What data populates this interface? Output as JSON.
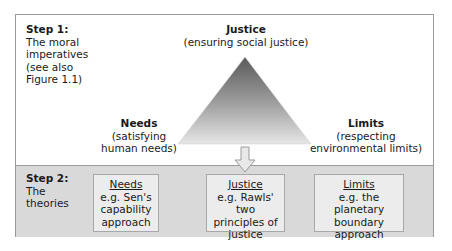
{
  "step1": {
    "title": "Step 1:",
    "description_lines": [
      "The moral",
      "imperatives",
      "(see also",
      "Figure 1.1)"
    ]
  },
  "triangle": {
    "top": {
      "name": "Justice",
      "sub": "(ensuring social justice)"
    },
    "left": {
      "name": "Needs",
      "sub_lines": [
        "(satisfying",
        "human needs)"
      ]
    },
    "right": {
      "name": "Limits",
      "sub_lines": [
        "(respecting",
        "environmental limits)"
      ]
    },
    "colors": {
      "apex": "#5a5a5a",
      "base": "#e4e4e4"
    }
  },
  "step2": {
    "title": "Step 2:",
    "description_lines": [
      "The",
      "theories"
    ],
    "theories": [
      {
        "name": "Needs",
        "lines": [
          "e.g. Sen's",
          "capability",
          "approach"
        ]
      },
      {
        "name": "Justice",
        "lines": [
          "e.g. Rawls' two",
          "principles of",
          "justice"
        ]
      },
      {
        "name": "Limits",
        "lines": [
          "e.g. the planetary",
          "boundary",
          "approach"
        ]
      }
    ]
  }
}
